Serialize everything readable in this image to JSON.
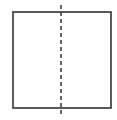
{
  "diagram": {
    "type": "square-with-symmetry-line",
    "square": {
      "x": 13,
      "y": 12,
      "width": 98,
      "height": 96,
      "stroke": "#333333",
      "stroke_width": 1.6
    },
    "symmetry_line": {
      "orientation": "vertical",
      "style": "dashed",
      "x": 61,
      "y1": 5,
      "y2": 114,
      "stroke": "#333333",
      "dash": "4,3"
    }
  }
}
